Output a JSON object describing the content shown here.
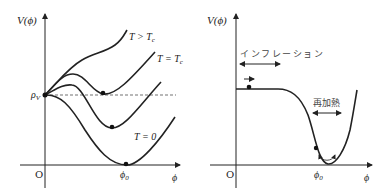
{
  "left_panel": {
    "y_axis_label": "V(ϕ)",
    "x_axis_label": "ϕ",
    "origin_label": "O",
    "rho_label": "ρ",
    "rho_sub": "V",
    "phi0_label": "ϕ",
    "phi0_sub": "0",
    "curves": [
      {
        "label": "T > T",
        "sub": "c",
        "name": "T-greater-than-Tc"
      },
      {
        "label": "T = T",
        "sub": "c",
        "name": "T-equals-Tc"
      },
      {
        "label": "T = 0",
        "sub": "",
        "name": "T-zero"
      }
    ]
  },
  "right_panel": {
    "y_axis_label": "V(ϕ)",
    "x_axis_label": "ϕ",
    "origin_label": "O",
    "phi0_label": "ϕ",
    "phi0_sub": "0",
    "inflation_label": "インフレーション",
    "reheating_label": "再加熱"
  },
  "colors": {
    "line": "#222222",
    "background": "#ffffff"
  }
}
